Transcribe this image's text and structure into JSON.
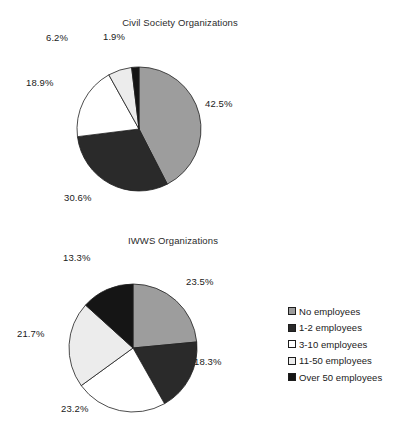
{
  "chart_data": [
    {
      "type": "pie",
      "title": "Civil Society Organizations",
      "categories": [
        "No employees",
        "1-2 employees",
        "3-10 employees",
        "11-50 employees",
        "Over 50 employees"
      ],
      "values": [
        42.5,
        30.6,
        18.9,
        6.2,
        1.9
      ],
      "labels": [
        "42.5%",
        "30.6%",
        "18.9%",
        "6.2%",
        "1.9%"
      ],
      "colors": [
        "#9d9d9d",
        "#2a2a2a",
        "#ffffff",
        "#ececec",
        "#151515"
      ],
      "start_angle_deg": 0,
      "direction": "clockwise",
      "legend": "shared",
      "xlabel": "",
      "ylabel": ""
    },
    {
      "type": "pie",
      "title": "IWWS Organizations",
      "categories": [
        "No employees",
        "1-2 employees",
        "3-10 employees",
        "11-50 employees",
        "Over 50 employees"
      ],
      "values": [
        23.5,
        18.3,
        23.2,
        21.7,
        13.3
      ],
      "labels": [
        "23.5%",
        "18.3%",
        "23.2%",
        "21.7%",
        "13.3%"
      ],
      "colors": [
        "#9d9d9d",
        "#2a2a2a",
        "#ffffff",
        "#ececec",
        "#151515"
      ],
      "start_angle_deg": 0,
      "direction": "clockwise",
      "legend": "shared",
      "xlabel": "",
      "ylabel": ""
    }
  ],
  "legend": {
    "position": "right",
    "items": [
      {
        "label": "No employees",
        "color": "#9d9d9d"
      },
      {
        "label": "1-2 employees",
        "color": "#2a2a2a"
      },
      {
        "label": "3-10 employees",
        "color": "#ffffff"
      },
      {
        "label": "11-50 employees",
        "color": "#ececec"
      },
      {
        "label": "Over 50 employees",
        "color": "#151515"
      }
    ]
  }
}
